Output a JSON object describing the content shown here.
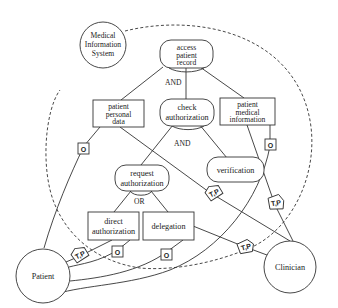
{
  "diagram": {
    "type": "goal-model",
    "system": {
      "label_lines": [
        "Medical",
        "Information",
        "System"
      ]
    },
    "actors": {
      "patient": {
        "label": "Patient"
      },
      "clinician": {
        "label": "Clinician"
      }
    },
    "goals": {
      "access_patient_record": {
        "label_lines": [
          "access",
          "patient",
          "record"
        ]
      },
      "check_authorization": {
        "label_lines": [
          "check",
          "authorization"
        ]
      },
      "request_authorization": {
        "label_lines": [
          "request",
          "authorization"
        ]
      },
      "verification": {
        "label_lines": [
          "verification"
        ]
      }
    },
    "resources": {
      "patient_personal_data": {
        "label_lines": [
          "patient",
          "personal",
          "data"
        ]
      },
      "patient_medical_information": {
        "label_lines": [
          "patient",
          "medical",
          "information"
        ]
      },
      "direct_authorization": {
        "label_lines": [
          "direct",
          "authorization"
        ]
      },
      "delegation": {
        "label_lines": [
          "delegation"
        ]
      }
    },
    "decompositions": {
      "access_and": "AND",
      "check_and": "AND",
      "request_or": "OR"
    },
    "tags": {
      "owner": "O",
      "trust_permission": "T,P"
    }
  }
}
